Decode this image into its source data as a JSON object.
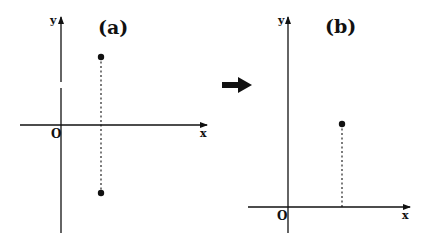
{
  "panels": [
    {
      "id": "a",
      "title": "(a)",
      "x_axis_label": "x",
      "y_axis_label": "y",
      "origin_label": "O",
      "points": [
        {
          "description": "upper point above x-axis",
          "px": 101,
          "py": 57
        },
        {
          "description": "lower point below x-axis",
          "px": 101,
          "py": 193
        }
      ],
      "dotted_line": "vertical dotted segment joining the two points, crossing the x-axis"
    },
    {
      "id": "b",
      "title": "(b)",
      "x_axis_label": "x",
      "y_axis_label": "y",
      "origin_label": "O",
      "points": [
        {
          "description": "single point in first quadrant",
          "px": 342,
          "py": 124
        }
      ],
      "dotted_line": "vertical dotted segment from the point down to the x-axis"
    }
  ],
  "transition_arrow": {
    "icon": "right-arrow-icon",
    "direction": "right",
    "from": "(a)",
    "to": "(b)"
  },
  "colors": {
    "ink": "#111111",
    "background": "#ffffff"
  }
}
